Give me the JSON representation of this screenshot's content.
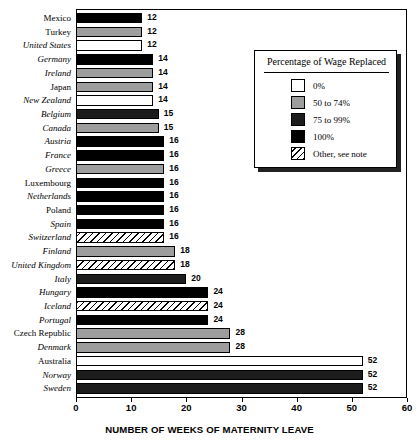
{
  "chart_data": {
    "type": "bar",
    "orientation": "horizontal",
    "title": "",
    "xlabel": "NUMBER OF WEEKS OF MATERNITY LEAVE",
    "ylabel": "",
    "xlim": [
      0,
      60
    ],
    "xticks": [
      0,
      10,
      20,
      30,
      40,
      50,
      60
    ],
    "grid": false,
    "legend_position": "upper-right-inset",
    "categories": [
      "Mexico",
      "Turkey",
      "United States",
      "Germany",
      "Ireland",
      "Japan",
      "New Zealand",
      "Belgium",
      "Canada",
      "Austria",
      "France",
      "Greece",
      "Luxembourg",
      "Netherlands",
      "Poland",
      "Spain",
      "Switzerland",
      "Finland",
      "United Kingdom",
      "Italy",
      "Hungary",
      "Iceland",
      "Portugal",
      "Czech Republic",
      "Denmark",
      "Australia",
      "Norway",
      "Sweden"
    ],
    "values": [
      12,
      12,
      12,
      14,
      14,
      14,
      14,
      15,
      15,
      16,
      16,
      16,
      16,
      16,
      16,
      16,
      16,
      18,
      18,
      20,
      24,
      24,
      24,
      28,
      28,
      52,
      52,
      52
    ],
    "categories_italic": [
      false,
      false,
      true,
      true,
      true,
      false,
      true,
      true,
      true,
      true,
      true,
      true,
      false,
      true,
      false,
      true,
      true,
      true,
      true,
      true,
      true,
      true,
      true,
      false,
      true,
      false,
      true,
      true
    ],
    "series_name": "Weeks of maternity leave",
    "bar_fill_class": [
      "p100",
      "p50",
      "p0",
      "p100",
      "p50",
      "p50",
      "p0",
      "p75",
      "p50",
      "p100",
      "p100",
      "p50",
      "p100",
      "p100",
      "p100",
      "p100",
      "other",
      "p50",
      "other",
      "p75",
      "p100",
      "other",
      "p100",
      "p50",
      "p50",
      "p0",
      "p75",
      "p75"
    ],
    "bar_wage_category": [
      "100%",
      "50 to 74%",
      "0%",
      "100%",
      "50 to 74%",
      "50 to 74%",
      "0%",
      "75 to 99%",
      "50 to 74%",
      "100%",
      "100%",
      "50 to 74%",
      "100%",
      "100%",
      "100%",
      "100%",
      "Other, see note",
      "50 to 74%",
      "Other, see note",
      "75 to 99%",
      "100%",
      "Other, see note",
      "100%",
      "50 to 74%",
      "50 to 74%",
      "0%",
      "75 to 99%",
      "75 to 99%"
    ]
  },
  "legend": {
    "title": "Percentage of Wage Replaced",
    "items": [
      {
        "label": "0%",
        "fill": "p0"
      },
      {
        "label": "50 to 74%",
        "fill": "p50"
      },
      {
        "label": "75 to 99%",
        "fill": "p75"
      },
      {
        "label": "100%",
        "fill": "p100"
      },
      {
        "label": "Other, see note",
        "fill": "other"
      }
    ]
  }
}
